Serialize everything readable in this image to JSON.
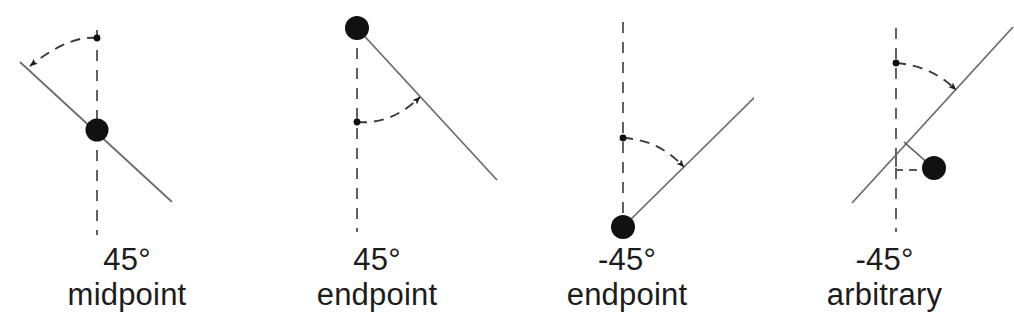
{
  "figure": {
    "background_color": "#ffffff",
    "stroke_color": "#4a4a4a",
    "marker_color": "#111111",
    "text_color": "#1c1c1c"
  },
  "panels": [
    {
      "id": "panel-45-midpoint",
      "angle_label": "45°",
      "kind_label": "midpoint",
      "angle_value": 45,
      "anchor": "midpoint",
      "description": "Line rotated 45 degrees about a marker placed at the midpoint of the line; dashed vertical reference axis passes through the marker, and a dashed arc with arrowhead sweeps from the vertical to the line.",
      "marker": {
        "x": 97,
        "y": 130,
        "r": 11
      },
      "line": {
        "x1": 20,
        "y1": 62,
        "x2": 172,
        "y2": 202
      },
      "axis": {
        "x1": 97,
        "y1": 30,
        "x2": 97,
        "y2": 235
      },
      "arc": {
        "from_x": 97,
        "from_y": 38,
        "to_x": 28,
        "to_y": 68,
        "pivot_dot_x": 97,
        "pivot_dot_y": 38
      },
      "arrow_direction": "counterclockwise"
    },
    {
      "id": "panel-45-endpoint",
      "angle_label": "45°",
      "kind_label": "endpoint",
      "angle_value": 45,
      "anchor": "endpoint",
      "description": "Line rotated 45 degrees about a marker placed at the upper endpoint of the line; dashed vertical reference axis descends from the marker, and a dashed arc with arrowhead sweeps from the vertical to the line.",
      "marker": {
        "x": 107,
        "y": 28,
        "r": 12
      },
      "line": {
        "x1": 107,
        "y1": 28,
        "x2": 245,
        "y2": 178
      },
      "axis": {
        "x1": 107,
        "y1": 28,
        "x2": 107,
        "y2": 232
      },
      "arc": {
        "from_x": 107,
        "from_y": 122,
        "to_x": 168,
        "to_y": 95,
        "pivot_dot_x": 107,
        "pivot_dot_y": 122
      },
      "arrow_direction": "clockwise"
    },
    {
      "id": "panel-minus45-endpoint",
      "angle_label": "-45°",
      "kind_label": "endpoint",
      "angle_value": -45,
      "anchor": "endpoint",
      "description": "Line rotated minus 45 degrees about a marker placed at the lower endpoint of the line; dashed vertical reference axis rises from the marker, and a dashed arc with arrowhead sweeps from the vertical to the line.",
      "marker": {
        "x": 123,
        "y": 227,
        "r": 12
      },
      "line": {
        "x1": 123,
        "y1": 227,
        "x2": 264,
        "y2": 88
      },
      "axis": {
        "x1": 123,
        "y1": 22,
        "x2": 123,
        "y2": 227
      },
      "arc": {
        "from_x": 123,
        "from_y": 138,
        "to_x": 182,
        "to_y": 165,
        "pivot_dot_x": 123,
        "pivot_dot_y": 138
      },
      "arrow_direction": "clockwise"
    },
    {
      "id": "panel-minus45-arbitrary",
      "angle_label": "-45°",
      "kind_label": "arbitrary",
      "angle_value": -45,
      "anchor": "arbitrary",
      "description": "Line rotated minus 45 degrees about an arbitrary marker positioned off the line; dashed vertical reference axis and a dashed arc with arrowhead show the rotation, and dashed right-angle offset guides connect the marker to the line and to the axis.",
      "marker": {
        "x": 179,
        "y": 168,
        "r": 12
      },
      "line": {
        "x1": 100,
        "y1": 200,
        "x2": 258,
        "y2": 30
      },
      "axis": {
        "x1": 141,
        "y1": 28,
        "x2": 141,
        "y2": 232
      },
      "arc": {
        "from_x": 141,
        "from_y": 63,
        "to_x": 199,
        "to_y": 88,
        "pivot_dot_x": 141,
        "pivot_dot_y": 63
      },
      "offset_leader": {
        "x1": 179,
        "y1": 168,
        "x2": 151,
        "y2": 143
      },
      "offset_guide": {
        "x1": 179,
        "y1": 170,
        "x2": 141,
        "y2": 170
      },
      "right_angle_mark": {
        "corner_x": 141,
        "corner_y": 170,
        "size": 11
      },
      "arrow_direction": "clockwise"
    }
  ]
}
